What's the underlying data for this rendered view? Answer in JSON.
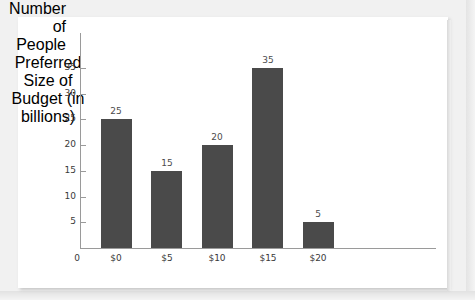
{
  "chart_data": {
    "type": "bar",
    "title": "",
    "xlabel": "Preferred Size of Budget (in billions)",
    "ylabel": "Number of People",
    "categories": [
      "$0",
      "$5",
      "$10",
      "$15",
      "$20"
    ],
    "values": [
      25,
      15,
      20,
      35,
      5
    ],
    "value_labels": [
      "25",
      "15",
      "20",
      "35",
      "5"
    ],
    "ylim": [
      0,
      35
    ],
    "ytick_values": [
      0,
      5,
      10,
      15,
      20,
      25,
      30,
      35
    ],
    "ytick_labels": [
      "0",
      "5",
      "10",
      "15",
      "20",
      "25",
      "30",
      "35"
    ],
    "grid": false,
    "legend": "none",
    "bar_color": "#4a4a4a",
    "axis_color": "#9a9a9a",
    "panel_color": "#ffffff",
    "background_color": "#f1f1f1"
  },
  "axis_titles": {
    "y_line_1": "Number of",
    "y_line_2": "People",
    "x_line_1": "Preferred Size of",
    "x_line_2": "Budget (in billions)"
  },
  "origin_label": "0"
}
